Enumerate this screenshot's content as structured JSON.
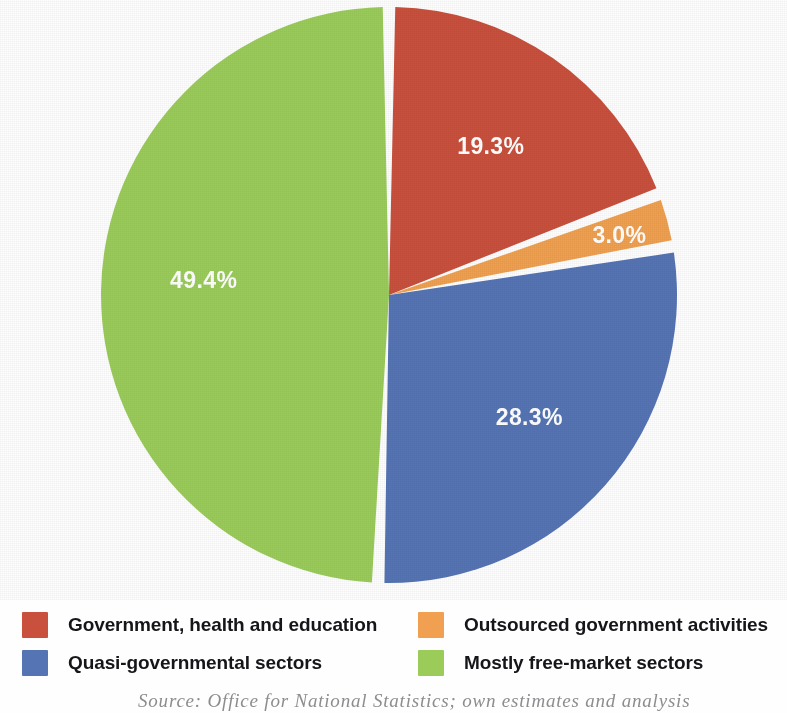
{
  "chart_data": {
    "type": "pie",
    "title": "",
    "labels": [
      "Government, health and education",
      "Outsourced government activities",
      "Quasi-governmental sectors",
      "Mostly free-market sectors"
    ],
    "values": [
      19.3,
      3.0,
      28.3,
      49.4
    ],
    "value_labels": [
      "19.3%",
      "3.0%",
      "28.3%",
      "49.4%"
    ],
    "colors": [
      "#c8503c",
      "#f0a050",
      "#5574b4",
      "#9bcc5a"
    ],
    "units": "percent",
    "start_angle_deg": 0,
    "direction": "clockwise",
    "legend_position": "bottom",
    "grid": false,
    "slices": [
      {
        "label": "Government, health and education",
        "value": 19.3,
        "value_label": "19.3%",
        "color": "#c8503c"
      },
      {
        "label": "Outsourced government activities",
        "value": 3.0,
        "value_label": "3.0%",
        "color": "#f0a050"
      },
      {
        "label": "Quasi-governmental sectors",
        "value": 28.3,
        "value_label": "28.3%",
        "color": "#5574b4"
      },
      {
        "label": "Mostly free-market sectors",
        "value": 49.4,
        "value_label": "49.4%",
        "color": "#9bcc5a"
      }
    ]
  },
  "pie": {
    "labels": {
      "red": "19.3%",
      "orange": "3.0%",
      "blue": "28.3%",
      "green": "49.4%"
    }
  },
  "legend": {
    "items": [
      {
        "label": "Government, health and education",
        "color": "#c8503c"
      },
      {
        "label": "Outsourced government activities",
        "color": "#f0a050"
      },
      {
        "label": "Quasi-governmental sectors",
        "color": "#5574b4"
      },
      {
        "label": "Mostly free-market sectors",
        "color": "#9bcc5a"
      }
    ]
  },
  "source": {
    "text": "Source: Office for National Statistics; own estimates and analysis"
  }
}
